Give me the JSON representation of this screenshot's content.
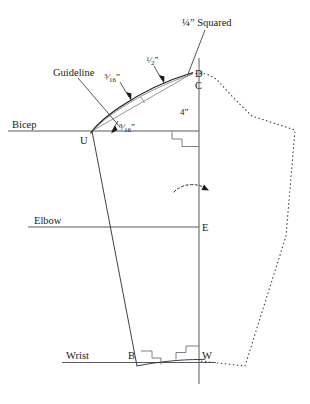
{
  "figure": {
    "type": "technical-line-drawing",
    "background_color": "#ffffff",
    "ink_color": "#1a1a1a",
    "rule_color": "#555b60"
  },
  "labels": {
    "squared": "¼” Squared",
    "guideline": "Guideline",
    "bicep": "Bicep",
    "elbow": "Elbow",
    "wrist": "Wrist",
    "depth": "4”"
  },
  "points": {
    "d": "D",
    "c": "C",
    "u": "U",
    "e": "E",
    "b": "B",
    "w": "W"
  },
  "measurements": {
    "cap_upper": {
      "whole": "",
      "numerator": "3",
      "denominator": "16",
      "unit": "”"
    },
    "cap_mid": {
      "whole": "",
      "numerator": "1",
      "denominator": "2",
      "unit": "”"
    },
    "cap_lower": {
      "whole": "",
      "numerator": "3",
      "denominator": "16",
      "unit": "”"
    }
  },
  "geometry": {
    "center_line": {
      "x": 199,
      "y_top": 58,
      "y_bottom": 384
    },
    "bicep_line": {
      "x_start": 8,
      "x_end": 199,
      "y": 131
    },
    "elbow_line": {
      "x_start": 28,
      "x_end": 199,
      "y": 227
    },
    "wrist_line": {
      "x_start": 62,
      "x_end": 215,
      "y": 362
    },
    "point_positions": {
      "D": {
        "x": 193,
        "y": 72
      },
      "C": {
        "x": 193,
        "y": 84
      },
      "U": {
        "x": 92,
        "y": 131
      },
      "E": {
        "x": 199,
        "y": 227
      },
      "B": {
        "x": 140,
        "y": 360
      },
      "W": {
        "x": 199,
        "y": 362
      }
    }
  },
  "annotations": {
    "rotation_arrow": "dashed curved arrow pointing right across the center line",
    "square_marks": 3
  }
}
